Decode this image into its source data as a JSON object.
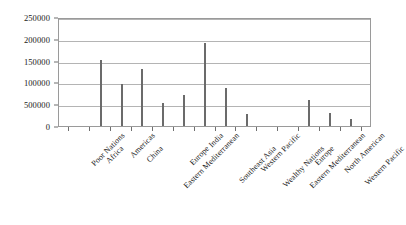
{
  "chart_data": {
    "type": "bar",
    "title": "",
    "subtitle": "",
    "xlabel": "",
    "ylabel": "",
    "grid": true,
    "legend": "none",
    "ylim": [
      0,
      250000
    ],
    "ytick_labels": [
      "250000",
      "200000",
      "150000",
      "100000",
      "500000",
      "0"
    ],
    "ytick_values": [
      250000,
      200000,
      150000,
      100000,
      50000,
      0
    ],
    "categories": [
      "Poor Nations",
      "Africa",
      "Americas",
      "China",
      "Eastern Mediterranean",
      "Europe",
      "India",
      "Southeast Asia",
      "Western Pacific",
      "Wealthy Nations",
      "Eastern Mediterranean",
      "Europe",
      "North American",
      "Western Pacific"
    ],
    "values": [
      0,
      152000,
      97000,
      130000,
      52000,
      72000,
      190000,
      88000,
      27000,
      0,
      0,
      60000,
      30000,
      17000
    ],
    "series": [
      {
        "name": "Population",
        "values": [
          0,
          152000,
          97000,
          130000,
          52000,
          72000,
          190000,
          88000,
          27000,
          0,
          0,
          60000,
          30000,
          17000
        ]
      }
    ],
    "colors": {
      "bar": "#6b6b6b",
      "grid": "#b4b4b4",
      "axis": "#9a9a9a",
      "text": "#1a1a1a",
      "background": "#ffffff"
    }
  }
}
